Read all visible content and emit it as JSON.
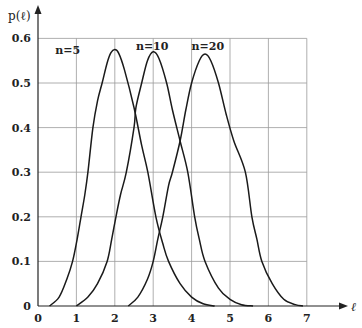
{
  "chart_data": {
    "type": "line",
    "title": "",
    "xlabel": "ℓ",
    "ylabel": "p(ℓ)",
    "xlim": [
      0,
      7
    ],
    "ylim": [
      0,
      0.6
    ],
    "grid": true,
    "x_ticks": [
      "0",
      "1",
      "2",
      "3",
      "4",
      "5",
      "6",
      "7"
    ],
    "y_ticks": [
      "0",
      "0.1",
      "0.2",
      "0.3",
      "0.4",
      "0.5",
      "0.6"
    ],
    "legend": "inline labels above peaks",
    "series": [
      {
        "name": "n=5",
        "label_pos": [
          0.45,
          0.565
        ],
        "points": [
          [
            0.3,
            0
          ],
          [
            0.55,
            0.02
          ],
          [
            0.75,
            0.06
          ],
          [
            0.9,
            0.1
          ],
          [
            1.02,
            0.15
          ],
          [
            1.12,
            0.2
          ],
          [
            1.22,
            0.25
          ],
          [
            1.3,
            0.3
          ],
          [
            1.43,
            0.4
          ],
          [
            1.55,
            0.46
          ],
          [
            1.67,
            0.5
          ],
          [
            1.8,
            0.545
          ],
          [
            1.9,
            0.568
          ],
          [
            2.0,
            0.575
          ],
          [
            2.1,
            0.567
          ],
          [
            2.25,
            0.53
          ],
          [
            2.5,
            0.445
          ],
          [
            2.7,
            0.36
          ],
          [
            2.86,
            0.3
          ],
          [
            3.07,
            0.2
          ],
          [
            3.25,
            0.14
          ],
          [
            3.4,
            0.1
          ],
          [
            3.7,
            0.05
          ],
          [
            4.0,
            0.02
          ],
          [
            4.3,
            0.005
          ],
          [
            4.6,
            0
          ]
        ]
      },
      {
        "name": "n=10",
        "label_pos": [
          2.55,
          0.575
        ],
        "points": [
          [
            1.0,
            0
          ],
          [
            1.3,
            0.02
          ],
          [
            1.55,
            0.05
          ],
          [
            1.8,
            0.1
          ],
          [
            1.92,
            0.15
          ],
          [
            2.03,
            0.2
          ],
          [
            2.15,
            0.25
          ],
          [
            2.3,
            0.3
          ],
          [
            2.5,
            0.4
          ],
          [
            2.55,
            0.445
          ],
          [
            2.7,
            0.5
          ],
          [
            2.85,
            0.55
          ],
          [
            3.0,
            0.57
          ],
          [
            3.15,
            0.555
          ],
          [
            3.35,
            0.5
          ],
          [
            3.5,
            0.44
          ],
          [
            3.7,
            0.37
          ],
          [
            3.9,
            0.3
          ],
          [
            4.08,
            0.2
          ],
          [
            4.2,
            0.15
          ],
          [
            4.35,
            0.1
          ],
          [
            4.7,
            0.04
          ],
          [
            5.0,
            0.015
          ],
          [
            5.3,
            0.003
          ],
          [
            5.6,
            0
          ]
        ]
      },
      {
        "name": "n=20",
        "label_pos": [
          4.0,
          0.575
        ],
        "points": [
          [
            2.35,
            0
          ],
          [
            2.6,
            0.02
          ],
          [
            2.85,
            0.06
          ],
          [
            3.0,
            0.1
          ],
          [
            3.12,
            0.15
          ],
          [
            3.25,
            0.2
          ],
          [
            3.4,
            0.27
          ],
          [
            3.5,
            0.3
          ],
          [
            3.7,
            0.37
          ],
          [
            3.85,
            0.44
          ],
          [
            4.0,
            0.5
          ],
          [
            4.2,
            0.55
          ],
          [
            4.35,
            0.565
          ],
          [
            4.5,
            0.55
          ],
          [
            4.7,
            0.5
          ],
          [
            4.9,
            0.43
          ],
          [
            5.1,
            0.37
          ],
          [
            5.4,
            0.3
          ],
          [
            5.57,
            0.2
          ],
          [
            5.7,
            0.15
          ],
          [
            5.83,
            0.1
          ],
          [
            6.1,
            0.05
          ],
          [
            6.4,
            0.015
          ],
          [
            6.7,
            0.003
          ],
          [
            6.9,
            0
          ]
        ]
      }
    ]
  }
}
